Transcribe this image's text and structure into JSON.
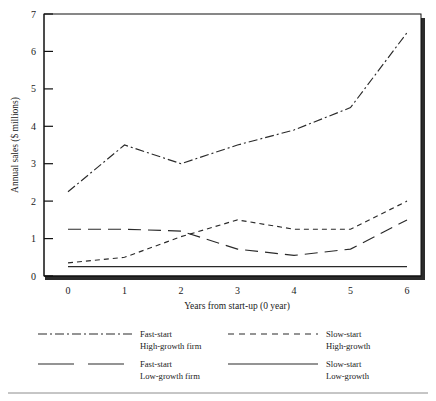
{
  "figure": {
    "bottom_rule": "horizontal-rule"
  },
  "axes": {
    "y_title": "Annual sales ($ millions)",
    "x_title": "Years from start-up (0 year)",
    "y_ticks": [
      "0",
      "1",
      "2",
      "3",
      "4",
      "5",
      "6",
      "7"
    ],
    "x_ticks": [
      "0",
      "1",
      "2",
      "3",
      "4",
      "5",
      "6"
    ]
  },
  "legend": {
    "entries": [
      {
        "label_line1": "Fast-start",
        "label_line2": "High-growth firm",
        "style": "dash-dot",
        "swatch": "fast-start-high-growth-swatch"
      },
      {
        "label_line1": "Slow-start",
        "label_line2": "High-growth",
        "style": "dashed",
        "swatch": "slow-start-high-growth-swatch"
      },
      {
        "label_line1": "Fast-start",
        "label_line2": "Low-growth firm",
        "style": "long-dash",
        "swatch": "fast-start-low-growth-swatch"
      },
      {
        "label_line1": "Slow-start",
        "label_line2": "Low-growth",
        "style": "solid",
        "swatch": "slow-start-low-growth-swatch"
      }
    ]
  },
  "chart_data": {
    "type": "line",
    "title": "",
    "xlabel": "Years from start-up (0 year)",
    "ylabel": "Annual sales ($ millions)",
    "x": [
      0,
      1,
      2,
      3,
      4,
      5,
      6
    ],
    "xlim": [
      0,
      6
    ],
    "ylim": [
      0,
      7
    ],
    "grid": false,
    "legend_position": "below-axes",
    "series": [
      {
        "name": "Fast-start High-growth firm",
        "style": "dash-dot",
        "color": "#2a2a2a",
        "values": [
          2.25,
          3.5,
          3.0,
          3.5,
          3.9,
          4.5,
          6.5
        ]
      },
      {
        "name": "Slow-start High-growth",
        "style": "dashed",
        "color": "#2a2a2a",
        "values": [
          0.35,
          0.5,
          1.05,
          1.5,
          1.25,
          1.25,
          2.0
        ]
      },
      {
        "name": "Fast-start Low-growth firm",
        "style": "long-dash",
        "color": "#2a2a2a",
        "values": [
          1.25,
          1.25,
          1.2,
          0.72,
          0.55,
          0.72,
          1.5
        ]
      },
      {
        "name": "Slow-start Low-growth",
        "style": "solid",
        "color": "#2a2a2a",
        "values": [
          0.25,
          0.25,
          0.25,
          0.25,
          0.25,
          0.25,
          0.25
        ]
      }
    ]
  }
}
